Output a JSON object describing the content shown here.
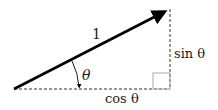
{
  "diagram": {
    "hypotenuse_label": "1",
    "angle_label": "θ",
    "opposite_label": "sin θ",
    "adjacent_label": "cos θ",
    "colors": {
      "vector": "#000000",
      "dashed": "#333333",
      "right_angle_box": "#aaaaaa"
    }
  }
}
